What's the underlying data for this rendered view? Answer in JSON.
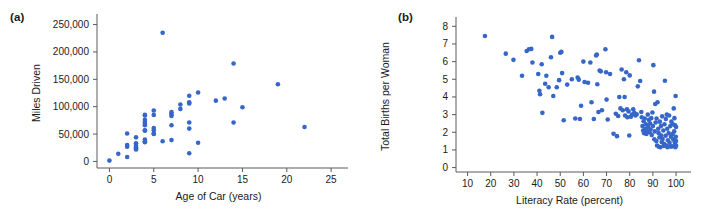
{
  "figure": {
    "panel_a_label": "(a)",
    "panel_b_label": "(b)",
    "point_color": "#3566c8",
    "axis_color": "#5a5a5a",
    "background": "#ffffff"
  },
  "chart_data": [
    {
      "type": "scatter",
      "panel": "(a)",
      "title": "",
      "xlabel": "Age of Car (years)",
      "ylabel": "Miles Driven",
      "xlim": [
        -1.4,
        26.0
      ],
      "ylim": [
        -12000,
        262000
      ],
      "xticks": [
        0,
        5,
        10,
        15,
        20,
        25
      ],
      "xtick_labels": [
        "0",
        "5",
        "10",
        "15",
        "20",
        "25"
      ],
      "yticks": [
        0,
        50000,
        100000,
        150000,
        200000,
        250000
      ],
      "ytick_labels": [
        "0",
        "50,000",
        "100,000",
        "150,000",
        "200,000",
        "250,000"
      ],
      "grid": false,
      "legend": "none",
      "marker": "circle",
      "points": [
        [
          0,
          1500
        ],
        [
          1,
          14000
        ],
        [
          2,
          8000
        ],
        [
          2,
          51000
        ],
        [
          2,
          30000
        ],
        [
          2,
          27000
        ],
        [
          3,
          44000
        ],
        [
          3,
          33000
        ],
        [
          3,
          29000
        ],
        [
          3,
          26000
        ],
        [
          3,
          23000
        ],
        [
          3,
          22000
        ],
        [
          4,
          85000
        ],
        [
          4,
          84000
        ],
        [
          4,
          76000
        ],
        [
          4,
          72000
        ],
        [
          4,
          69000
        ],
        [
          4,
          66000
        ],
        [
          4,
          57000
        ],
        [
          4,
          56000
        ],
        [
          4,
          40000
        ],
        [
          4,
          37000
        ],
        [
          4,
          35000
        ],
        [
          5,
          93000
        ],
        [
          5,
          85000
        ],
        [
          5,
          61000
        ],
        [
          5,
          57000
        ],
        [
          5,
          51000
        ],
        [
          5,
          50000
        ],
        [
          6,
          235000
        ],
        [
          6,
          37000
        ],
        [
          7,
          90000
        ],
        [
          7,
          86000
        ],
        [
          7,
          83000
        ],
        [
          7,
          66000
        ],
        [
          7,
          39000
        ],
        [
          8,
          104000
        ],
        [
          8,
          96000
        ],
        [
          9,
          120000
        ],
        [
          9,
          108000
        ],
        [
          9,
          106000
        ],
        [
          9,
          71000
        ],
        [
          9,
          60000
        ],
        [
          9,
          15000
        ],
        [
          10,
          126000
        ],
        [
          10,
          34000
        ],
        [
          12,
          111000
        ],
        [
          13,
          115000
        ],
        [
          14,
          179000
        ],
        [
          14,
          71000
        ],
        [
          15,
          99000
        ],
        [
          19,
          141000
        ],
        [
          22,
          63000
        ]
      ]
    },
    {
      "type": "scatter",
      "panel": "(b)",
      "title": "",
      "xlabel": "Literacy Rate (percent)",
      "ylabel": "Total Births per Woman",
      "xlim": [
        5,
        103
      ],
      "ylim": [
        -0.25,
        8.3
      ],
      "xticks": [
        10,
        20,
        30,
        40,
        50,
        60,
        70,
        80,
        90,
        100
      ],
      "xtick_labels": [
        "10",
        "20",
        "30",
        "40",
        "50",
        "60",
        "70",
        "80",
        "90",
        "100"
      ],
      "yticks": [
        0,
        1,
        2,
        3,
        4,
        5,
        6,
        7,
        8
      ],
      "ytick_labels": [
        "0",
        "1",
        "2",
        "3",
        "4",
        "5",
        "6",
        "7",
        "8"
      ],
      "grid": false,
      "legend": "none",
      "marker": "circle",
      "points": [
        [
          17.5,
          7.45
        ],
        [
          26.5,
          6.45
        ],
        [
          29.8,
          6.1
        ],
        [
          33.5,
          5.2
        ],
        [
          35.5,
          6.6
        ],
        [
          36.5,
          6.7
        ],
        [
          37.5,
          6.72
        ],
        [
          38.0,
          5.95
        ],
        [
          40.5,
          5.3
        ],
        [
          41.0,
          4.35
        ],
        [
          41.3,
          4.15
        ],
        [
          42.0,
          5.85
        ],
        [
          42.3,
          3.1
        ],
        [
          43.5,
          4.75
        ],
        [
          44.0,
          5.2
        ],
        [
          45.0,
          4.55
        ],
        [
          46.0,
          6.25
        ],
        [
          46.5,
          7.4
        ],
        [
          47.0,
          4.05
        ],
        [
          48.5,
          4.55
        ],
        [
          49.5,
          4.95
        ],
        [
          50.0,
          6.5
        ],
        [
          50.5,
          6.55
        ],
        [
          50.8,
          5.35
        ],
        [
          51.5,
          2.68
        ],
        [
          53.0,
          4.7
        ],
        [
          55.0,
          5.0
        ],
        [
          56.5,
          2.78
        ],
        [
          57.5,
          5.1
        ],
        [
          58.0,
          4.98
        ],
        [
          58.5,
          2.75
        ],
        [
          59.0,
          3.5
        ],
        [
          60.0,
          6.0
        ],
        [
          60.5,
          4.85
        ],
        [
          62.0,
          4.8
        ],
        [
          63.0,
          5.95
        ],
        [
          63.5,
          3.7
        ],
        [
          64.5,
          2.75
        ],
        [
          65.5,
          6.35
        ],
        [
          65.8,
          6.4
        ],
        [
          66.0,
          4.72
        ],
        [
          66.5,
          3.15
        ],
        [
          67.0,
          5.5
        ],
        [
          67.5,
          5.45
        ],
        [
          68.0,
          3.25
        ],
        [
          69.5,
          6.7
        ],
        [
          69.8,
          5.4
        ],
        [
          70.0,
          3.85
        ],
        [
          70.5,
          2.72
        ],
        [
          71.5,
          5.3
        ],
        [
          73.0,
          1.92
        ],
        [
          74.0,
          3.05
        ],
        [
          74.5,
          1.78
        ],
        [
          75.0,
          2.92
        ],
        [
          75.5,
          4.0
        ],
        [
          76.0,
          3.35
        ],
        [
          76.5,
          5.55
        ],
        [
          77.0,
          3.25
        ],
        [
          77.5,
          5.0
        ],
        [
          77.8,
          4.0
        ],
        [
          78.0,
          2.95
        ],
        [
          78.5,
          5.4
        ],
        [
          78.8,
          3.3
        ],
        [
          79.0,
          2.85
        ],
        [
          79.5,
          3.18
        ],
        [
          79.8,
          1.82
        ],
        [
          80.0,
          5.22
        ],
        [
          80.5,
          2.88
        ],
        [
          81.0,
          3.0
        ],
        [
          81.5,
          3.3
        ],
        [
          82.0,
          3.1
        ],
        [
          82.5,
          2.95
        ],
        [
          83.0,
          3.02
        ],
        [
          83.5,
          4.6
        ],
        [
          84.0,
          6.08
        ],
        [
          84.5,
          4.9
        ],
        [
          85.0,
          3.15
        ],
        [
          85.2,
          2.85
        ],
        [
          85.5,
          2.35
        ],
        [
          85.8,
          2.1
        ],
        [
          86.0,
          2.62
        ],
        [
          86.2,
          1.95
        ],
        [
          86.5,
          2.78
        ],
        [
          86.8,
          2.2
        ],
        [
          87.0,
          2.45
        ],
        [
          87.2,
          1.9
        ],
        [
          87.5,
          2.05
        ],
        [
          87.8,
          3.0
        ],
        [
          88.0,
          2.3
        ],
        [
          88.3,
          2.7
        ],
        [
          88.5,
          2.0
        ],
        [
          88.8,
          2.5
        ],
        [
          89.0,
          2.15
        ],
        [
          89.3,
          2.8
        ],
        [
          89.5,
          1.85
        ],
        [
          89.8,
          3.12
        ],
        [
          90.0,
          2.35
        ],
        [
          90.2,
          5.8
        ],
        [
          90.5,
          4.3
        ],
        [
          90.8,
          2.05
        ],
        [
          91.0,
          3.6
        ],
        [
          91.2,
          2.55
        ],
        [
          91.5,
          1.5
        ],
        [
          91.8,
          1.25
        ],
        [
          92.0,
          3.7
        ],
        [
          92.3,
          2.2
        ],
        [
          92.5,
          1.95
        ],
        [
          92.8,
          1.7
        ],
        [
          93.0,
          2.6
        ],
        [
          93.2,
          1.15
        ],
        [
          93.5,
          2.35
        ],
        [
          93.8,
          1.45
        ],
        [
          94.0,
          2.9
        ],
        [
          94.2,
          1.62
        ],
        [
          94.5,
          2.1
        ],
        [
          94.8,
          1.35
        ],
        [
          95.0,
          2.45
        ],
        [
          95.2,
          4.92
        ],
        [
          95.5,
          1.8
        ],
        [
          95.8,
          1.25
        ],
        [
          96.0,
          3.0
        ],
        [
          96.2,
          2.2
        ],
        [
          96.5,
          1.55
        ],
        [
          96.8,
          1.95
        ],
        [
          97.0,
          2.95
        ],
        [
          97.2,
          1.4
        ],
        [
          97.5,
          2.35
        ],
        [
          97.8,
          1.75
        ],
        [
          98.0,
          2.6
        ],
        [
          98.2,
          1.2
        ],
        [
          98.5,
          1.9
        ],
        [
          98.8,
          1.6
        ],
        [
          99.0,
          3.35
        ],
        [
          99.2,
          2.05
        ],
        [
          99.4,
          1.45
        ],
        [
          99.5,
          1.3
        ],
        [
          99.6,
          2.4
        ],
        [
          99.7,
          1.15
        ],
        [
          99.8,
          4.05
        ],
        [
          99.9,
          1.75
        ],
        [
          100.0,
          2.3
        ],
        [
          100.0,
          1.5
        ],
        [
          100.0,
          1.25
        ],
        [
          99.3,
          2.8
        ],
        [
          98.6,
          2.45
        ],
        [
          97.6,
          1.2
        ],
        [
          96.3,
          1.15
        ],
        [
          95.6,
          2.75
        ],
        [
          94.6,
          1.22
        ],
        [
          93.6,
          1.82
        ],
        [
          92.6,
          1.18
        ],
        [
          91.6,
          2.78
        ],
        [
          90.6,
          1.6
        ]
      ]
    }
  ]
}
